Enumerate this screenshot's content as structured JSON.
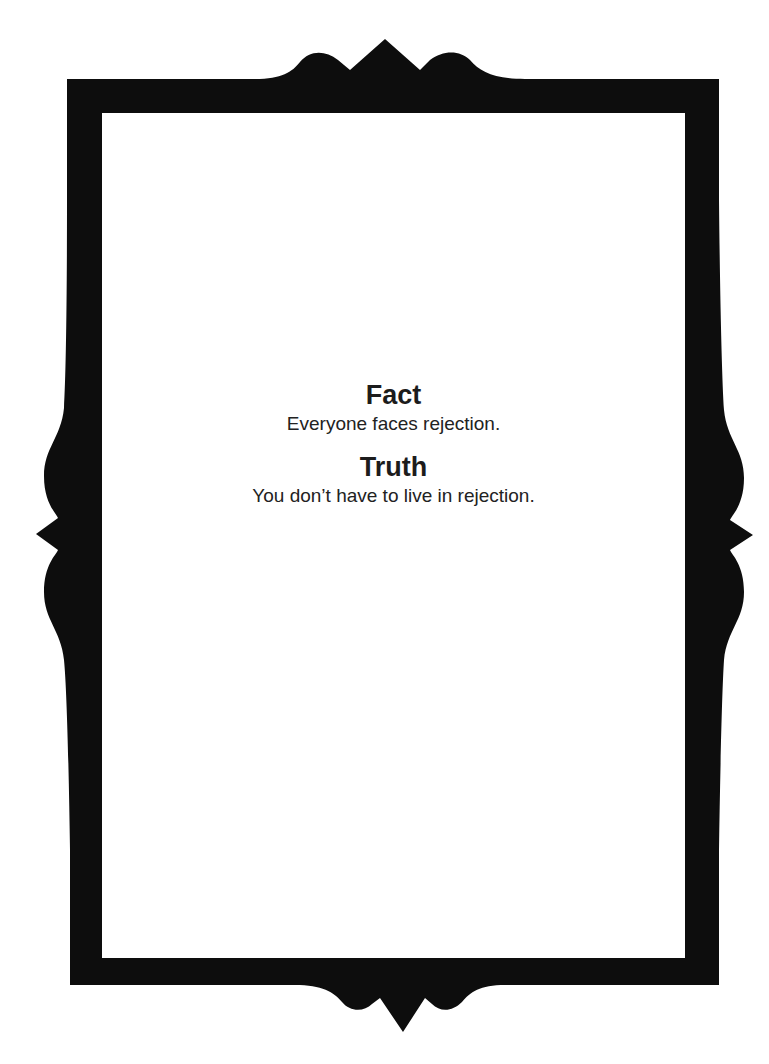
{
  "card": {
    "sections": [
      {
        "heading": "Fact",
        "text": "Everyone faces rejection."
      },
      {
        "heading": "Truth",
        "text": "You don’t have to live in rejection."
      }
    ]
  },
  "frame": {
    "color": "#0d0d0d",
    "inner_color": "#ffffff",
    "style": "ornate-black-border"
  }
}
